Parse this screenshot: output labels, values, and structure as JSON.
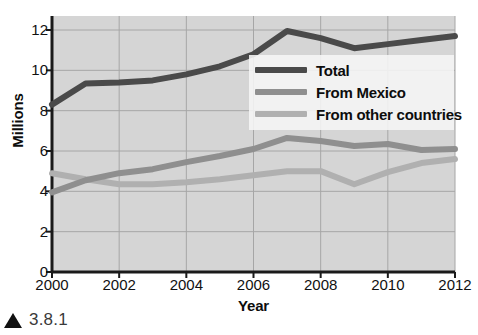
{
  "figure": {
    "caption_marker": "triangle-marker",
    "caption": "3.8.1"
  },
  "chart_data": {
    "type": "line",
    "title": "",
    "xlabel": "Year",
    "ylabel": "Millions",
    "xlim": [
      2000,
      2012
    ],
    "ylim": [
      0,
      12
    ],
    "xticks": [
      2000,
      2002,
      2004,
      2006,
      2008,
      2010,
      2012
    ],
    "yticks": [
      0,
      2,
      4,
      6,
      8,
      10,
      12
    ],
    "grid": true,
    "legend_position": "center-right",
    "plot_background": "#d5d5d5",
    "x": [
      2000,
      2001,
      2002,
      2003,
      2004,
      2005,
      2006,
      2007,
      2008,
      2009,
      2010,
      2011,
      2012
    ],
    "series": [
      {
        "name": "Total",
        "color": "#4a4a4a",
        "values": [
          8.3,
          9.35,
          9.4,
          9.5,
          9.8,
          10.2,
          10.8,
          11.95,
          11.6,
          11.1,
          11.3,
          11.5,
          11.7
        ]
      },
      {
        "name": "From Mexico",
        "color": "#8f8f8f",
        "values": [
          3.95,
          4.55,
          4.9,
          5.1,
          5.45,
          5.75,
          6.1,
          6.65,
          6.5,
          6.25,
          6.35,
          6.05,
          6.1
        ]
      },
      {
        "name": "From other countries",
        "color": "#b0b0b0",
        "values": [
          4.9,
          4.6,
          4.35,
          4.35,
          4.45,
          4.6,
          4.8,
          5.0,
          5.0,
          4.35,
          4.95,
          5.4,
          5.6
        ]
      }
    ]
  },
  "legend": {
    "items": [
      {
        "label": "Total",
        "color": "#4a4a4a"
      },
      {
        "label": "From Mexico",
        "color": "#8f8f8f"
      },
      {
        "label": "From other countries",
        "color": "#b0b0b0"
      }
    ]
  }
}
